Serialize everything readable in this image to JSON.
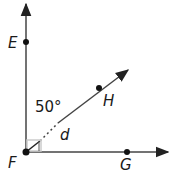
{
  "diagram": {
    "points": [
      {
        "id": "E",
        "label": "E"
      },
      {
        "id": "F",
        "label": "F"
      },
      {
        "id": "G",
        "label": "G"
      },
      {
        "id": "H",
        "label": "H"
      }
    ],
    "rays": [
      {
        "from": "F",
        "through": "E"
      },
      {
        "from": "F",
        "through": "H"
      },
      {
        "from": "F",
        "through": "G"
      }
    ],
    "angle_labels": {
      "angle_EFH": "50°",
      "angle_HFG": "d"
    },
    "right_angle_at": "F",
    "colors": {
      "line": "#444444",
      "point": "#111111",
      "marker_highlight": "#cccccc"
    }
  }
}
